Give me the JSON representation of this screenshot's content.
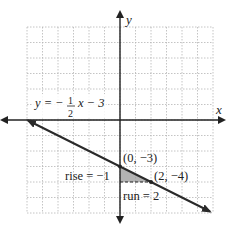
{
  "chart_data": {
    "type": "line",
    "title": "",
    "xlabel": "x",
    "ylabel": "y",
    "xlim": [
      -6,
      6
    ],
    "ylim": [
      -6,
      6
    ],
    "grid": true,
    "equation": {
      "lhs": "y = −",
      "num": "1",
      "den": "2",
      "rhs": "x − 3"
    },
    "series": [
      {
        "name": "y = -1/2 x - 3",
        "slope": -0.5,
        "intercept": -3,
        "x": [
          -6,
          5.7
        ],
        "y": [
          0,
          -5.85
        ]
      }
    ],
    "points": [
      {
        "label": "(0, −3)",
        "x": 0,
        "y": -3
      },
      {
        "label": "(2, −4)",
        "x": 2,
        "y": -4
      }
    ],
    "annotations": {
      "rise": "rise = −1",
      "run": "run = 2"
    },
    "colors": {
      "axis": "#222222",
      "grid": "#b5b5b5",
      "line": "#2a2a2a",
      "triangle": "#9a9a9a"
    }
  }
}
